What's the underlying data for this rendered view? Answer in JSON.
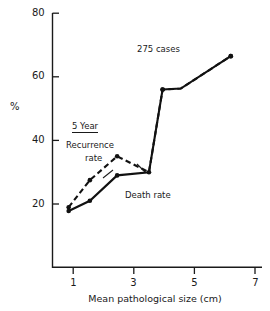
{
  "chart_data": {
    "type": "line",
    "title": "",
    "xlabel": "Mean pathological size (cm)",
    "ylabel": "%",
    "xlim": [
      0.2,
      7.0
    ],
    "ylim": [
      0,
      80
    ],
    "xticks": [
      1,
      3,
      5,
      7
    ],
    "yticks": [
      20,
      40,
      60,
      80
    ],
    "grid": false,
    "legend_position": "inline-annotations",
    "series": [
      {
        "name": "Death rate",
        "style": "solid",
        "marker": "filled-circle",
        "points": [
          {
            "x": 0.85,
            "y": 17.8
          },
          {
            "x": 1.55,
            "y": 21.0
          },
          {
            "x": 2.45,
            "y": 29.0
          },
          {
            "x": 3.5,
            "y": 30.0
          },
          {
            "x": 3.95,
            "y": 56.0
          },
          {
            "x": 4.55,
            "y": 56.3
          },
          {
            "x": 6.2,
            "y": 66.5
          }
        ]
      },
      {
        "name": "Recurrence rate",
        "style": "dashed",
        "marker": "filled-circle",
        "points": [
          {
            "x": 0.85,
            "y": 19.0
          },
          {
            "x": 1.55,
            "y": 27.5
          },
          {
            "x": 2.45,
            "y": 35.0
          },
          {
            "x": 3.5,
            "y": 30.0
          },
          {
            "x": 3.95,
            "y": 56.0
          },
          {
            "x": 4.55,
            "y": 56.3
          },
          {
            "x": 6.2,
            "y": 66.5
          }
        ]
      }
    ],
    "annotations": [
      {
        "name": "cases-count",
        "text": "275 cases",
        "x": 3.3,
        "y": 71
      },
      {
        "name": "five-year",
        "text": "5 Year",
        "x": 1.45,
        "y": 45.5,
        "underlined": true
      },
      {
        "name": "recurrence-rate-label",
        "text": "Recurrence",
        "x": 1.35,
        "y": 40.0
      },
      {
        "name": "recurrence-rate-label-2",
        "text": "rate",
        "x": 1.72,
        "y": 36.0
      },
      {
        "name": "death-rate-label",
        "text": "Death rate",
        "x": 2.95,
        "y": 23.8
      }
    ]
  },
  "axis": {
    "y_title": "%",
    "x_title": "Mean pathological size (cm)",
    "y_tick_labels": [
      "80",
      "60",
      "40",
      "20"
    ],
    "x_tick_labels": [
      "1",
      "3",
      "5",
      "7"
    ]
  },
  "labels": {
    "cases": "275 cases",
    "five_year": "5 Year",
    "recurrence_line1": "Recurrence",
    "recurrence_line2": "rate",
    "death_rate": "Death rate"
  },
  "colors": {
    "ink": "#1a1a1a",
    "background": "#ffffff"
  }
}
